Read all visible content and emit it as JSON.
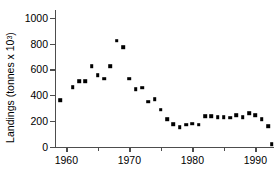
{
  "chart_data": {
    "type": "scatter",
    "title": "",
    "xlabel": "",
    "ylabel": "Landings (tonnes x 10",
    "ylabel_exponent": "3",
    "ylabel_suffix": ")",
    "xlim": [
      1958.2,
      1992.8
    ],
    "ylim": [
      0,
      1060
    ],
    "grid": false,
    "legend": null,
    "marker": "square",
    "marker_color": "#000000",
    "axis_color": "#4d4d4d",
    "yticks": [
      0,
      200,
      400,
      600,
      800,
      1000
    ],
    "ytick_labels": [
      "0",
      "200",
      "400",
      "600",
      "800",
      "1000"
    ],
    "xticks_major": [
      1960,
      1970,
      1980,
      1990
    ],
    "xtick_labels": [
      "1960",
      "1970",
      "1980",
      "1990"
    ],
    "xticks_minor": [
      1965,
      1975,
      1985
    ],
    "x": [
      1959,
      1961,
      1962,
      1963,
      1964,
      1965,
      1966,
      1967,
      1968,
      1969,
      1970,
      1971,
      1972,
      1973,
      1974,
      1975,
      1976,
      1977,
      1978,
      1979,
      1980,
      1981,
      1982,
      1983,
      1984,
      1985,
      1986,
      1987,
      1988,
      1989,
      1990,
      1991,
      1992
    ],
    "values": [
      362,
      462,
      508,
      508,
      625,
      556,
      528,
      625,
      822,
      770,
      530,
      448,
      458,
      352,
      370,
      288,
      215,
      178,
      152,
      172,
      180,
      172,
      238,
      240,
      230,
      232,
      228,
      248,
      232,
      262,
      248,
      215,
      160
    ],
    "x_extra": [
      1992
    ],
    "values_extra": [
      22
    ],
    "series": [
      {
        "name": "Landings",
        "points": [
          [
            1959,
            362
          ],
          [
            1961,
            462
          ],
          [
            1962,
            508
          ],
          [
            1963,
            508
          ],
          [
            1964,
            625
          ],
          [
            1965,
            556
          ],
          [
            1966,
            528
          ],
          [
            1967,
            625
          ],
          [
            1968,
            822
          ],
          [
            1969,
            770
          ],
          [
            1970,
            530
          ],
          [
            1971,
            448
          ],
          [
            1972,
            458
          ],
          [
            1973,
            352
          ],
          [
            1974,
            370
          ],
          [
            1975,
            288
          ],
          [
            1976,
            215
          ],
          [
            1977,
            178
          ],
          [
            1978,
            152
          ],
          [
            1979,
            172
          ],
          [
            1980,
            180
          ],
          [
            1981,
            172
          ],
          [
            1982,
            238
          ],
          [
            1983,
            240
          ],
          [
            1984,
            230
          ],
          [
            1985,
            232
          ],
          [
            1986,
            228
          ],
          [
            1987,
            248
          ],
          [
            1988,
            232
          ],
          [
            1989,
            262
          ],
          [
            1990,
            248
          ],
          [
            1991,
            215
          ],
          [
            1992,
            160
          ],
          [
            1992.6,
            22
          ]
        ]
      }
    ]
  }
}
